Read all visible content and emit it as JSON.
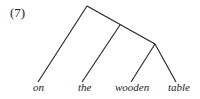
{
  "example_number": "(7)",
  "tree": {
    "leaves": [
      "on",
      "the",
      "wooden",
      "table"
    ],
    "structure": "[on [the [wooden table]]]"
  },
  "colors": {
    "line": "#222222",
    "background": "#ffffff"
  }
}
